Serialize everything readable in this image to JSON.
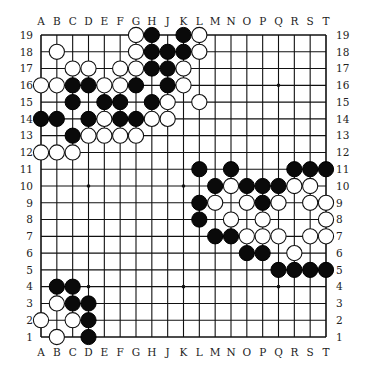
{
  "diagram": {
    "type": "go-board",
    "size": 19,
    "column_labels": [
      "A",
      "B",
      "C",
      "D",
      "E",
      "F",
      "G",
      "H",
      "J",
      "K",
      "L",
      "M",
      "N",
      "O",
      "P",
      "Q",
      "R",
      "S",
      "T"
    ],
    "row_labels": [
      "19",
      "18",
      "17",
      "16",
      "15",
      "14",
      "13",
      "12",
      "11",
      "10",
      "9",
      "8",
      "7",
      "6",
      "5",
      "4",
      "3",
      "2",
      "1"
    ],
    "star_points": [
      "D16",
      "K16",
      "Q16",
      "D10",
      "K10",
      "Q10",
      "D4",
      "K4",
      "Q4"
    ],
    "colors": {
      "line": "#111111",
      "black_stone": "#0a0a0a",
      "white_stone": "#ffffff",
      "background": "#ffffff"
    },
    "stones": {
      "black": [
        "H19",
        "K19",
        "H18",
        "J18",
        "K18",
        "H17",
        "J17",
        "C16",
        "D16",
        "G16",
        "J16",
        "C15",
        "E15",
        "F15",
        "H15",
        "A14",
        "B14",
        "D14",
        "F14",
        "G14",
        "C13",
        "L11",
        "N11",
        "R11",
        "S11",
        "T11",
        "M10",
        "O10",
        "P10",
        "Q10",
        "L9",
        "P9",
        "L8",
        "M7",
        "N7",
        "O6",
        "P6",
        "Q5",
        "R5",
        "S5",
        "T5",
        "B4",
        "C4",
        "C3",
        "D3",
        "D2",
        "D1"
      ],
      "white": [
        "G19",
        "L19",
        "B18",
        "G18",
        "L18",
        "C17",
        "D17",
        "F17",
        "G17",
        "K17",
        "A16",
        "B16",
        "E16",
        "F16",
        "K16",
        "J15",
        "L15",
        "E14",
        "H14",
        "J14",
        "D13",
        "E13",
        "F13",
        "G13",
        "A12",
        "B12",
        "C12",
        "N10",
        "R10",
        "S10",
        "M9",
        "O9",
        "Q9",
        "S9",
        "T9",
        "N8",
        "P8",
        "T8",
        "O7",
        "P7",
        "Q7",
        "S7",
        "T7",
        "R6",
        "B3",
        "A2",
        "C2",
        "B1"
      ]
    }
  }
}
